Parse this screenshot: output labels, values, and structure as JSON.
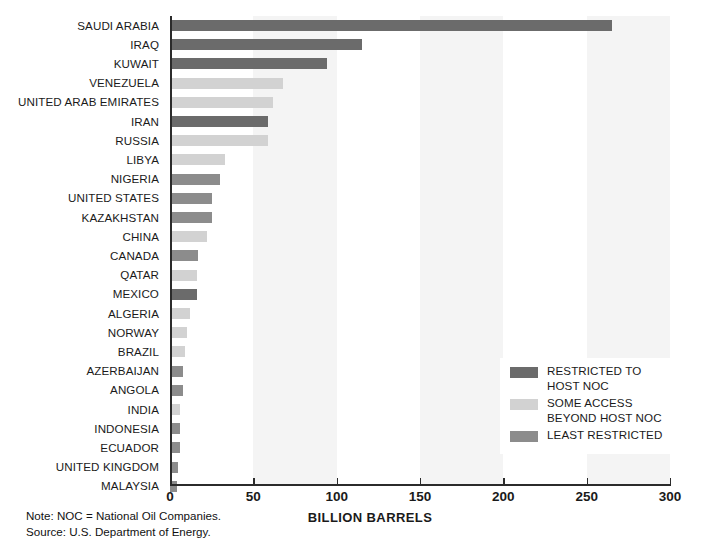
{
  "chart_data": {
    "type": "bar",
    "orientation": "horizontal",
    "title": "",
    "xlabel": "BILLION BARRELS",
    "ylabel": "",
    "xlim": [
      0,
      300
    ],
    "xticks": [
      0,
      50,
      100,
      150,
      200,
      250,
      300
    ],
    "grid": false,
    "banded_background": true,
    "categories": [
      "SAUDI ARABIA",
      "IRAQ",
      "KUWAIT",
      "VENEZUELA",
      "UNITED ARAB EMIRATES",
      "IRAN",
      "RUSSIA",
      "LIBYA",
      "NIGERIA",
      "UNITED STATES",
      "KAZAKHSTAN",
      "CHINA",
      "CANADA",
      "QATAR",
      "MEXICO",
      "ALGERIA",
      "NORWAY",
      "BRAZIL",
      "AZERBAIJAN",
      "ANGOLA",
      "INDIA",
      "INDONESIA",
      "ECUADOR",
      "UNITED KINGDOM",
      "MALAYSIA"
    ],
    "values": [
      265,
      115,
      94,
      68,
      62,
      59,
      59,
      33,
      30,
      25,
      25,
      22,
      17,
      16,
      16,
      12,
      10,
      9,
      8,
      8,
      6,
      6,
      6,
      5,
      4
    ],
    "access_group": [
      "restricted",
      "restricted",
      "restricted",
      "some-access",
      "some-access",
      "restricted",
      "some-access",
      "some-access",
      "least-restricted",
      "least-restricted",
      "least-restricted",
      "some-access",
      "least-restricted",
      "some-access",
      "restricted",
      "some-access",
      "some-access",
      "some-access",
      "least-restricted",
      "least-restricted",
      "some-access",
      "least-restricted",
      "least-restricted",
      "least-restricted",
      "least-restricted"
    ],
    "legend": {
      "position": "inside-lower-right",
      "entries": [
        {
          "key": "restricted",
          "lines": [
            "RESTRICTED TO",
            "HOST NOC"
          ],
          "color": "#6b6b6b"
        },
        {
          "key": "some-access",
          "lines": [
            "SOME ACCESS",
            "BEYOND HOST NOC"
          ],
          "color": "#d2d2d2"
        },
        {
          "key": "least-restricted",
          "lines": [
            "LEAST RESTRICTED"
          ],
          "color": "#8c8c8c"
        }
      ]
    },
    "bands": [
      {
        "from": 50,
        "to": 100
      },
      {
        "from": 150,
        "to": 200
      },
      {
        "from": 250,
        "to": 300
      }
    ],
    "annotations": [
      "Note: NOC = National Oil Companies.",
      "Source:  U.S. Department of Energy."
    ]
  },
  "colors": {
    "restricted": "#6b6b6b",
    "some_access": "#d2d2d2",
    "least_restricted": "#8c8c8c",
    "band": "#f4f4f4",
    "axis": "#2b2b2b",
    "text": "#1a1a1a",
    "background": "#ffffff"
  },
  "notes": {
    "line1": "Note: NOC = National Oil Companies.",
    "line2": "Source:  U.S. Department of Energy."
  },
  "axis": {
    "x_title": "BILLION BARRELS"
  }
}
